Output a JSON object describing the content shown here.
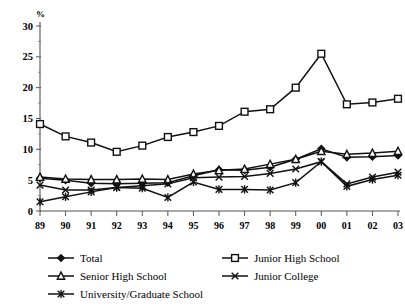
{
  "chart_data": {
    "type": "line",
    "title": "",
    "xlabel": "",
    "ylabel": "%",
    "ylim": [
      0,
      30
    ],
    "yticks": [
      0,
      5,
      10,
      15,
      20,
      25,
      30
    ],
    "ytick_labels": [
      "0",
      "5",
      "10",
      "15",
      "20",
      "25",
      "30"
    ],
    "minor_ticks": true,
    "grid": false,
    "legend_position": "bottom",
    "categories": [
      "89",
      "90",
      "91",
      "92",
      "93",
      "94",
      "95",
      "96",
      "97",
      "98",
      "99",
      "00",
      "01",
      "02",
      "03"
    ],
    "x": [
      "89",
      "90",
      "91",
      "92",
      "93",
      "94",
      "95",
      "96",
      "97",
      "98",
      "99",
      "00",
      "01",
      "02",
      "03"
    ],
    "series": [
      {
        "name": "Total",
        "marker": "filled-diamond",
        "values": [
          5.3,
          5.0,
          4.5,
          4.4,
          4.5,
          4.6,
          5.7,
          6.7,
          6.6,
          7.1,
          8.4,
          10.1,
          8.7,
          8.8,
          9.0
        ]
      },
      {
        "name": "Junior High School",
        "marker": "open-square",
        "values": [
          14.1,
          12.1,
          11.1,
          9.6,
          10.6,
          12.0,
          12.8,
          13.8,
          16.1,
          16.5,
          20.0,
          25.5,
          17.3,
          17.6,
          18.2
        ]
      },
      {
        "name": "Senior High School",
        "marker": "open-triangle",
        "values": [
          5.5,
          5.2,
          5.1,
          5.1,
          5.2,
          5.1,
          6.0,
          6.6,
          6.8,
          7.6,
          8.4,
          9.7,
          9.2,
          9.4,
          9.7
        ]
      },
      {
        "name": "Junior College",
        "marker": "cross-x",
        "values": [
          4.2,
          3.4,
          3.4,
          3.8,
          4.1,
          4.4,
          5.4,
          5.5,
          5.6,
          6.1,
          6.8,
          8.0,
          4.4,
          5.5,
          6.3
        ]
      },
      {
        "name": "University/Graduate School",
        "marker": "star",
        "values": [
          1.5,
          2.3,
          3.1,
          3.8,
          3.7,
          2.2,
          4.7,
          3.5,
          3.5,
          3.4,
          4.6,
          8.0,
          4.0,
          5.1,
          5.8
        ]
      }
    ],
    "legend_entries": [
      {
        "label": "Total",
        "marker": "filled-diamond"
      },
      {
        "label": "Junior High School",
        "marker": "open-square"
      },
      {
        "label": "Senior High School",
        "marker": "open-triangle"
      },
      {
        "label": "Junior College",
        "marker": "cross-x"
      },
      {
        "label": "University/Graduate School",
        "marker": "star"
      }
    ],
    "colors": {
      "line": "#111111",
      "axis": "#555555",
      "background": "#ffffff"
    }
  }
}
